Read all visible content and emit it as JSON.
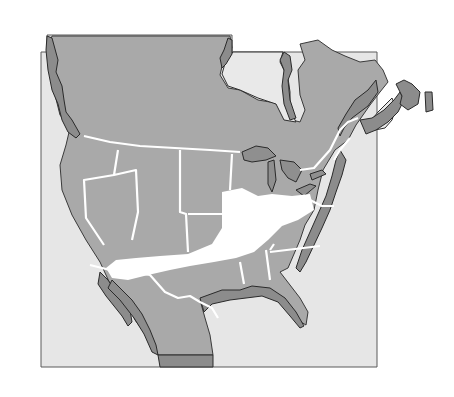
{
  "map": {
    "type": "shaded relief map",
    "subject": "North America (Canada, United States, Mexico)",
    "highlighted_region": "central United States band (white)",
    "colors": {
      "background": "#ffffff",
      "frame_fill": "#e6e6e6",
      "land": "#a9a9a9",
      "coastal_relief": "#8c8c8c",
      "highlight": "#ffffff",
      "borders": "#ffffff"
    },
    "labels": []
  }
}
